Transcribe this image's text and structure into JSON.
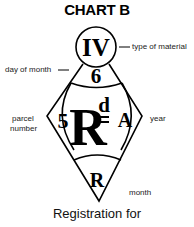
{
  "title": "CHART B",
  "marks": {
    "type_of_material": "IV",
    "day_of_month": "6",
    "parcel_number": "5",
    "registered_R": "R",
    "registered_d": "d",
    "year": "A",
    "month": "R"
  },
  "labels": {
    "type_of_material": "type of material",
    "day_of_month": "day of month",
    "parcel_number_line1": "parcel",
    "parcel_number_line2": "number",
    "year": "year",
    "month": "month"
  },
  "caption": "Registration for",
  "colors": {
    "ink": "#000000",
    "background": "#ffffff"
  }
}
